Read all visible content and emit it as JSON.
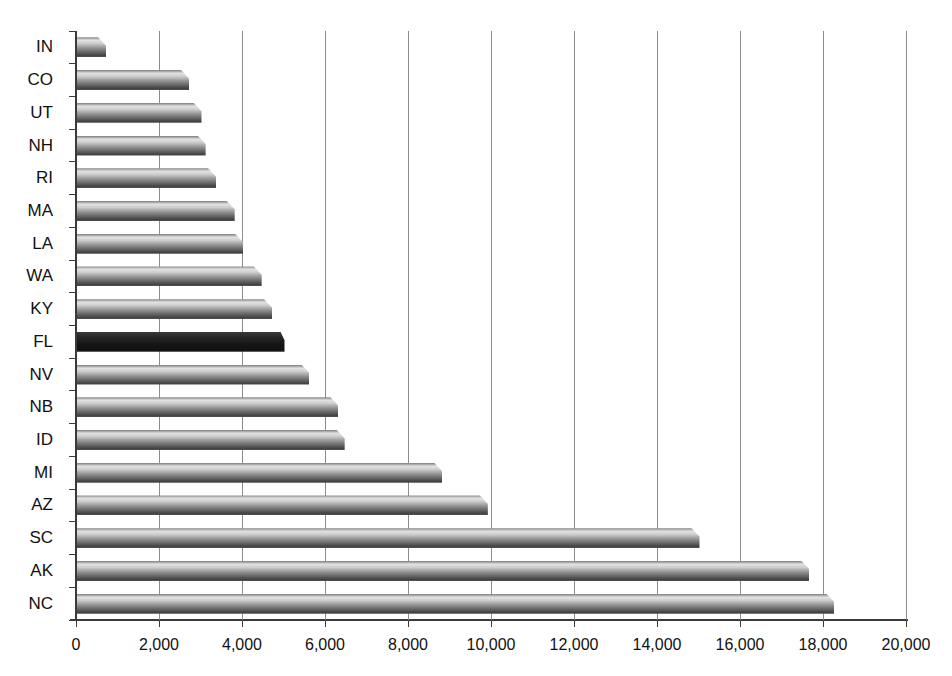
{
  "chart_data": {
    "type": "bar",
    "orientation": "horizontal",
    "title": "",
    "xlabel": "",
    "ylabel": "",
    "categories": [
      "IN",
      "CO",
      "UT",
      "NH",
      "RI",
      "MA",
      "LA",
      "WA",
      "KY",
      "FL",
      "NV",
      "NB",
      "ID",
      "MI",
      "AZ",
      "SC",
      "AK",
      "NC"
    ],
    "values": [
      700,
      2700,
      3000,
      3100,
      3350,
      3800,
      4000,
      4450,
      4700,
      5000,
      5600,
      6300,
      6450,
      8800,
      9900,
      15000,
      17650,
      18250
    ],
    "highlighted_category": "FL",
    "xlim": [
      0,
      20000
    ],
    "x_tick_interval": 2000,
    "x_tick_labels": [
      "0",
      "2,000",
      "4,000",
      "6,000",
      "8,000",
      "10,000",
      "12,000",
      "14,000",
      "16,000",
      "18,000",
      "20,000"
    ],
    "grid": true,
    "legend": false,
    "colors": {
      "bar_body": "#8a8a8a",
      "bar_highlight_band": "#e2e2e2",
      "bar_shadow": "#424242",
      "highlighted_bar": "#161616",
      "gridline": "#8c8c8c",
      "axis": "#3a3a3a",
      "text": "#111111",
      "background": "#ffffff"
    }
  }
}
